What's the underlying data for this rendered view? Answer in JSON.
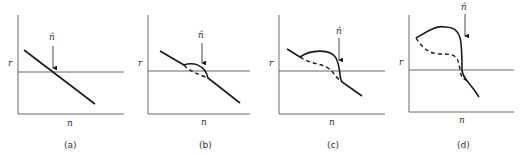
{
  "figure": {
    "panels": [
      {
        "id": "a",
        "caption": "(a)",
        "y_label": "r",
        "x_label": "n",
        "marker_label": "n̂"
      },
      {
        "id": "b",
        "caption": "(b)",
        "y_label": "r",
        "x_label": "n",
        "marker_label": "n̂"
      },
      {
        "id": "c",
        "caption": "(c)",
        "y_label": "r",
        "x_label": "n",
        "marker_label": "n̂"
      },
      {
        "id": "d",
        "caption": "(d)",
        "y_label": "r",
        "x_label": "n",
        "marker_label": "n̂"
      }
    ],
    "colors": {
      "line": "#1a1a1a",
      "axis": "#444444"
    }
  }
}
